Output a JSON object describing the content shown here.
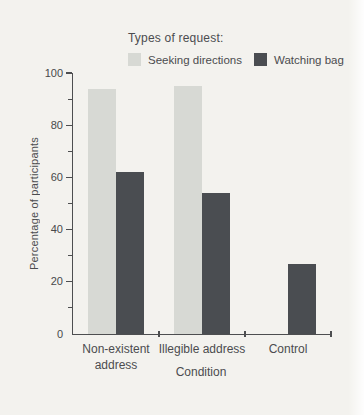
{
  "figure": {
    "background": "#f3f2ee",
    "axis_color": "#4d4e50",
    "text_color": "#4b4c4f"
  },
  "chart_data": {
    "type": "bar",
    "title": "Types of request:",
    "categories": [
      "Non-existent\naddress",
      "Illegible address",
      "Control"
    ],
    "series": [
      {
        "name": "Seeking directions",
        "color": "#d7d9d4",
        "values": [
          94,
          95,
          null
        ]
      },
      {
        "name": "Watching bag",
        "color": "#4a4d51",
        "values": [
          62,
          54,
          27
        ]
      }
    ],
    "xlabel": "Condition",
    "ylabel": "Percentage of participants",
    "ylim": [
      0,
      100
    ],
    "yticks": [
      0,
      20,
      40,
      60,
      80,
      100
    ],
    "minor_tick_step": 10,
    "legend_position": "top",
    "grid": false
  }
}
